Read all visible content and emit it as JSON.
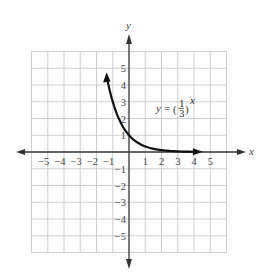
{
  "chart_data": {
    "type": "line",
    "title": "",
    "function": "y = (1/3)^x",
    "equation_label": {
      "y": "y",
      "eq": "=",
      "num": "1",
      "den": "3",
      "exp": "x"
    },
    "xlabel": "x",
    "ylabel": "y",
    "xlim": [
      -6,
      6
    ],
    "ylim": [
      -6,
      6
    ],
    "grid": true,
    "x_ticks": [
      -5,
      -4,
      -3,
      -2,
      -1,
      1,
      2,
      3,
      4,
      5
    ],
    "y_ticks": [
      5,
      4,
      3,
      2,
      1,
      -1,
      -2,
      -3,
      -4,
      -5
    ],
    "x_tick_labels": [
      "−5",
      "−4",
      "−3",
      "−2",
      "−1",
      "1",
      "2",
      "3",
      "4",
      "5"
    ],
    "y_tick_labels": [
      "5",
      "4",
      "3",
      "2",
      "1",
      "−1",
      "−2",
      "−3",
      "−4",
      "−5"
    ],
    "series": [
      {
        "name": "y = (1/3)^x",
        "x": [
          -1.3,
          -1.2,
          -1.0,
          -0.8,
          -0.6,
          -0.4,
          -0.2,
          0,
          0.25,
          0.5,
          0.75,
          1,
          1.5,
          2,
          2.5,
          3,
          3.5,
          4.3
        ],
        "y": [
          4.17,
          3.74,
          3.0,
          2.41,
          1.93,
          1.55,
          1.25,
          1.0,
          0.76,
          0.58,
          0.44,
          0.33,
          0.19,
          0.11,
          0.06,
          0.04,
          0.02,
          0.01
        ]
      }
    ],
    "legend": "none"
  }
}
